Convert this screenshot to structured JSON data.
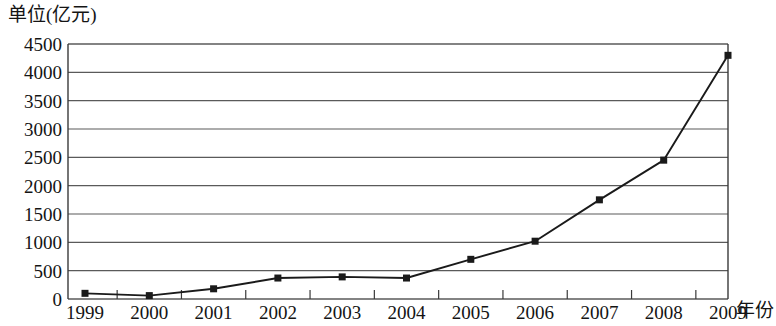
{
  "chart_data": {
    "type": "line",
    "title": "",
    "unit_caption": "单位(亿元)",
    "xlabel": "年份",
    "ylabel": "",
    "categories": [
      "1999",
      "2000",
      "2001",
      "2002",
      "2003",
      "2004",
      "2005",
      "2006",
      "2007",
      "2008",
      "2009"
    ],
    "values": [
      100,
      60,
      180,
      370,
      390,
      370,
      700,
      1020,
      1750,
      2450,
      4300
    ],
    "series": [
      {
        "name": "",
        "values": [
          100,
          60,
          180,
          370,
          390,
          370,
          700,
          1020,
          1750,
          2450,
          4300
        ]
      }
    ],
    "ylim": [
      0,
      4500
    ],
    "ytick_labels": [
      "0",
      "500",
      "1000",
      "1500",
      "2000",
      "2500",
      "3000",
      "3500",
      "4000",
      "4500"
    ],
    "ytick_values": [
      0,
      500,
      1000,
      1500,
      2000,
      2500,
      3000,
      3500,
      4000,
      4500
    ],
    "grid": true,
    "grid_orientation": "horizontal",
    "legend": false,
    "legend_position": "none",
    "marker": "square",
    "line_color": "#1a1a1a",
    "marker_color": "#1a1a1a",
    "grid_color": "#5a5a5a",
    "axis_color": "#3a3a3a",
    "background_color": "#ffffff"
  }
}
